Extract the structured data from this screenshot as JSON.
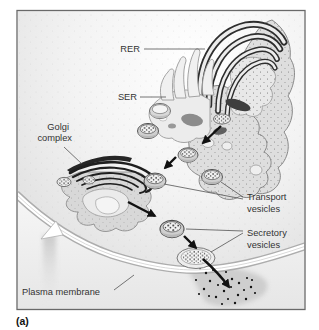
{
  "figure": {
    "panel_label": "(a)"
  },
  "labels": {
    "rer": "RER",
    "ser": "SER",
    "golgi": [
      "Golgi",
      "complex"
    ],
    "transport_vesicles": [
      "Transport",
      "vesicles"
    ],
    "secretory_vesicles": [
      "Secretory",
      "vesicles"
    ],
    "plasma_membrane": "Plasma membrane"
  },
  "colors": {
    "frame_border": "#696969",
    "ink": "#1c1c1c",
    "label_text": "#333333",
    "organelle_fill": "#dedede",
    "membrane_band": "#ffffff",
    "shading": "#c9c9c9",
    "dots": "#141414"
  }
}
